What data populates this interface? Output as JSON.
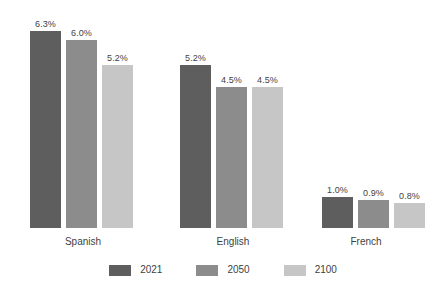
{
  "chart_data": {
    "type": "bar",
    "title": "",
    "subtitle": "",
    "xlabel": "",
    "ylabel": "",
    "ylim": [
      0,
      6.3
    ],
    "grid": false,
    "legend_position": "bottom",
    "value_suffix": "%",
    "categories": [
      "Spanish",
      "English",
      "French"
    ],
    "series": [
      {
        "name": "2021",
        "color": "#5e5e5e",
        "values": [
          6.3,
          5.2,
          1.0
        ],
        "labels": [
          "6.3%",
          "5.2%",
          "1.0%"
        ]
      },
      {
        "name": "2050",
        "color": "#8c8c8c",
        "values": [
          6.0,
          4.5,
          0.9
        ],
        "labels": [
          "6.0%",
          "4.5%",
          "0.9%"
        ]
      },
      {
        "name": "2100",
        "color": "#c6c6c6",
        "values": [
          5.2,
          4.5,
          0.8
        ],
        "labels": [
          "5.2%",
          "4.5%",
          "0.8%"
        ]
      }
    ]
  },
  "colors": {
    "background": "#ffffff",
    "text": "#3f3f3f",
    "series_2021": "#5e5e5e",
    "series_2050": "#8c8c8c",
    "series_2100": "#c6c6c6"
  },
  "groups": [
    {
      "category": "Spanish",
      "bars": [
        {
          "series": "2021",
          "label": "6.3%",
          "value": 6.3
        },
        {
          "series": "2050",
          "label": "6.0%",
          "value": 6.0
        },
        {
          "series": "2100",
          "label": "5.2%",
          "value": 5.2
        }
      ]
    },
    {
      "category": "English",
      "bars": [
        {
          "series": "2021",
          "label": "5.2%",
          "value": 5.2
        },
        {
          "series": "2050",
          "label": "4.5%",
          "value": 4.5
        },
        {
          "series": "2100",
          "label": "4.5%",
          "value": 4.5
        }
      ]
    },
    {
      "category": "French",
      "bars": [
        {
          "series": "2021",
          "label": "1.0%",
          "value": 1.0
        },
        {
          "series": "2050",
          "label": "0.9%",
          "value": 0.9
        },
        {
          "series": "2100",
          "label": "0.8%",
          "value": 0.8
        }
      ]
    }
  ],
  "legend": {
    "items": [
      {
        "label": "2021",
        "color": "#5e5e5e"
      },
      {
        "label": "2050",
        "color": "#8c8c8c"
      },
      {
        "label": "2100",
        "color": "#c6c6c6"
      }
    ]
  }
}
